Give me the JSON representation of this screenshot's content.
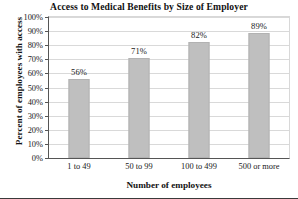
{
  "chart_data": {
    "type": "bar",
    "title": "Access to Medical Benefits by Size of Employer",
    "xlabel": "Number of employees",
    "ylabel": "Percent of employees with access",
    "categories": [
      "1 to 49",
      "50 to 99",
      "100 to 499",
      "500 or more"
    ],
    "values": [
      56,
      71,
      82,
      89
    ],
    "value_labels": [
      "56%",
      "71%",
      "82%",
      "89%"
    ],
    "ylim": [
      0,
      100
    ],
    "ytick_values": [
      0,
      10,
      20,
      30,
      40,
      50,
      60,
      70,
      80,
      90,
      100
    ],
    "ytick_labels": [
      "0%",
      "10%",
      "20%",
      "30%",
      "40%",
      "50%",
      "60%",
      "70%",
      "80%",
      "90%",
      "100%"
    ],
    "grid": true,
    "legend": "none",
    "bar_color": "#bfbfbf",
    "bar_edge_color": "#b2b2b2",
    "gridline_color": "#d9d9d9",
    "axis_color": "#555555",
    "text_color": "#1a1a1a"
  }
}
